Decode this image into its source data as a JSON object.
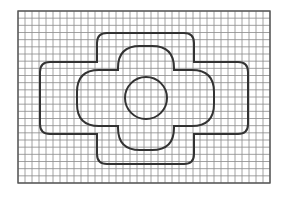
{
  "diagram": {
    "grid": {
      "x": 18,
      "y": 11,
      "width": 252,
      "height": 172,
      "cols": 36,
      "rows": 24,
      "line_color": "#8a8a8a",
      "border_color": "#555555"
    },
    "stroke_color": "#333333",
    "shapes": {
      "outer_cross": {
        "horizontal_arm": {
          "x1": 40,
          "y1": 62,
          "x2": 248,
          "y2": 134
        },
        "vertical_arm": {
          "x1": 97,
          "y1": 33,
          "x2": 194,
          "y2": 164
        },
        "corner_radius": 10
      },
      "inner_cross": {
        "horizontal_arm": {
          "x1": 77,
          "y1": 70,
          "x2": 214,
          "y2": 126
        },
        "vertical_arm": {
          "x1": 118,
          "y1": 46,
          "x2": 174,
          "y2": 150
        },
        "corner_radius": 22
      },
      "circle": {
        "cx": 146,
        "cy": 98,
        "r": 21
      }
    }
  }
}
